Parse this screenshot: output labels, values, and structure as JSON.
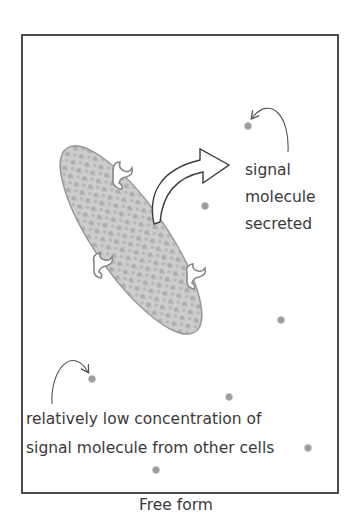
{
  "figure": {
    "caption": "Free form",
    "labels": {
      "secreted": [
        "signal",
        "molecule",
        "secreted"
      ],
      "low_concentration": [
        "relatively low concentration of",
        "signal molecule from other cells"
      ]
    },
    "elements": {
      "cell": "secreting cell with receptors",
      "receptor_count": 4,
      "signal_molecule_count": 7,
      "big_arrow": "secretion arrow",
      "pointer_arrows": 2
    },
    "colors": {
      "frame": "#4a4a4a",
      "cell_fill": "#c9c9c9",
      "cell_texture": "#a9a9a9",
      "cell_outline": "#9a9a9a",
      "molecule": "#9c9c9c",
      "text": "#3a3a3a",
      "arrow_stroke": "#3c3c3c"
    }
  }
}
